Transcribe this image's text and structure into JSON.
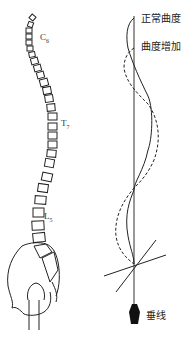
{
  "figure": {
    "spine_labels": [
      {
        "base": "C",
        "sub": "6"
      },
      {
        "base": "T",
        "sub": "7"
      },
      {
        "base": "L",
        "sub": "5"
      }
    ],
    "curve_labels": {
      "normal": "正常曲度",
      "increased": "曲度增加"
    },
    "plumb_label": "垂线",
    "legend_styles": {
      "normal": "solid",
      "increased": "dashed"
    },
    "colors": {
      "line": "#222222",
      "plumb_bob": "#111111"
    }
  }
}
